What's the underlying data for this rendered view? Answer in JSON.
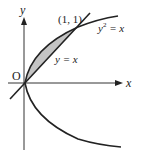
{
  "figure": {
    "axis_labels": {
      "x": "x",
      "y": "y",
      "origin": "O"
    },
    "point_label": "(1, 1)",
    "curve_labels": {
      "parabola_base": "y",
      "parabola_exp": "2",
      "parabola_rhs": " = x",
      "line": "y = x"
    },
    "colors": {
      "stroke": "#222222",
      "axis": "#333333",
      "shade": "#c4c4c4"
    }
  }
}
